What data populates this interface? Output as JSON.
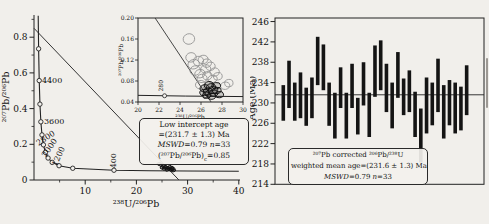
{
  "figure_type": "geochronology composite figure (Tera-Wasserburg concordia + weighted mean age)",
  "colors": {
    "ink": "#1a1a1a",
    "paper": "#f1efeb",
    "light_ellipse": "#909090",
    "dark_ellipse": "#161616"
  },
  "chart_data": [
    {
      "type": "scatter",
      "name": "tera-wasserburg-concordia",
      "xlabel": "²³⁸U/²⁰⁶Pb",
      "ylabel": "²⁰⁷Pb/²⁰⁶Pb",
      "xlim": [
        0,
        40
      ],
      "ylim": [
        0,
        0.92
      ],
      "xticks": [
        10,
        20,
        30,
        40
      ],
      "xminor": [
        5,
        15,
        25,
        35
      ],
      "ytick_labels": [
        "0",
        "0.2",
        "0.4",
        "0.6",
        "0.8"
      ],
      "yticks": [
        0,
        0.2,
        0.4,
        0.6,
        0.8
      ],
      "yminor": [
        0.1,
        0.3,
        0.5,
        0.7,
        0.9
      ],
      "concordia_curve": [
        [
          0.82,
          0.92
        ],
        [
          0.9,
          0.735
        ],
        [
          1.02,
          0.557
        ],
        [
          1.16,
          0.425
        ],
        [
          1.34,
          0.326
        ],
        [
          1.56,
          0.2525
        ],
        [
          1.84,
          0.197
        ],
        [
          2.22,
          0.155
        ],
        [
          2.75,
          0.123
        ],
        [
          3.55,
          0.0987
        ],
        [
          4.89,
          0.08
        ],
        [
          7.57,
          0.0658
        ],
        [
          15.62,
          0.0547
        ],
        [
          22.53,
          0.0519
        ],
        [
          30,
          0.0503
        ],
        [
          40,
          0.0493
        ]
      ],
      "age_markers": [
        [
          0.9,
          0.735
        ],
        [
          1.02,
          0.557
        ],
        [
          1.16,
          0.425
        ],
        [
          1.34,
          0.326
        ],
        [
          1.56,
          0.2525
        ],
        [
          1.84,
          0.197
        ],
        [
          2.22,
          0.155
        ],
        [
          2.75,
          0.123
        ],
        [
          3.55,
          0.0987
        ],
        [
          4.89,
          0.08
        ],
        [
          7.57,
          0.0658
        ],
        [
          15.62,
          0.0547
        ]
      ],
      "age_labels": [
        {
          "text": "4400",
          "x": 1.55,
          "y": 0.545,
          "rot": 0
        },
        {
          "text": "3600",
          "x": 1.95,
          "y": 0.315,
          "rot": 0
        },
        {
          "text": "2800",
          "x": 2.55,
          "y": 0.222,
          "rot": -33
        },
        {
          "text": "2000",
          "x": 3.45,
          "y": 0.172,
          "rot": -55
        },
        {
          "text": "1200",
          "x": 5.25,
          "y": 0.127,
          "rot": -66
        },
        {
          "text": "400",
          "x": 15.95,
          "y": 0.108,
          "rot": -90
        }
      ],
      "discordia": {
        "x1": 0,
        "y1": 0.85,
        "x2": 28.3,
        "y2": 0
      },
      "ellipses": [
        [
          24.45,
          0.091,
          0.42,
          0.008,
          -15
        ],
        [
          24.85,
          0.085,
          0.42,
          0.008,
          -15
        ],
        [
          25.25,
          0.079,
          0.42,
          0.008,
          -15
        ],
        [
          25.65,
          0.073,
          0.42,
          0.008,
          -15
        ],
        [
          26.05,
          0.068,
          0.42,
          0.008,
          -15
        ],
        [
          26.45,
          0.063,
          0.42,
          0.008,
          -15
        ],
        [
          26.85,
          0.058,
          0.42,
          0.008,
          -15
        ],
        [
          27.25,
          0.054,
          0.42,
          0.008,
          -15
        ],
        [
          25.45,
          0.064,
          0.42,
          0.008,
          -15
        ],
        [
          26.0,
          0.058,
          0.42,
          0.008,
          -15
        ],
        [
          26.5,
          0.073,
          0.42,
          0.008,
          -15
        ],
        [
          25.05,
          0.07,
          0.42,
          0.008,
          -15
        ],
        [
          26.9,
          0.068,
          0.42,
          0.008,
          -15
        ],
        [
          27.1,
          0.062,
          0.42,
          0.008,
          -15
        ]
      ],
      "annotation": {
        "line1": "Low intercept age",
        "line2": "=(231.7 ± 1.3) Ma",
        "mswd": "MSWD",
        "mswd_eq": "=0.79",
        "n": "n",
        "n_eq": "=33",
        "ratio": "(²⁰⁷Pb/²⁰⁶Pb)",
        "ratio_sub": "c",
        "ratio_eq": "=0.85"
      },
      "inset": {
        "xlabel": "²³⁸U/²⁰⁶Pb",
        "ylabel": "²⁰⁷Pb/²⁰⁶Pb",
        "xlim": [
          20,
          30
        ],
        "ylim": [
          0.04,
          0.2
        ],
        "xticks": [
          20,
          22,
          24,
          26,
          28,
          30
        ],
        "ytick_labels": [
          "0.04",
          "0.08",
          "0.12",
          "0.16",
          "0.20"
        ],
        "yticks": [
          0.04,
          0.08,
          0.12,
          0.16,
          0.2
        ],
        "concordia_curve": [
          [
            20,
            0.0527
          ],
          [
            22.53,
            0.0519
          ],
          [
            24.5,
            0.0513
          ],
          [
            26.36,
            0.051
          ],
          [
            28,
            0.0507
          ],
          [
            30,
            0.0503
          ]
        ],
        "age_markers": [
          [
            22.53,
            0.0519
          ],
          [
            26.36,
            0.051
          ]
        ],
        "age_labels": [
          {
            "text": "280",
            "x": 22.42,
            "y": 0.06,
            "rot": -90
          }
        ],
        "discordia": {
          "x1": 21.63,
          "y1": 0.2,
          "x2": 26.96,
          "y2": 0.04
        },
        "ellipses_light": [
          [
            24.85,
            0.16,
            0.55,
            0.01,
            -15
          ],
          [
            25.05,
            0.125,
            0.5,
            0.009,
            -12
          ],
          [
            25.3,
            0.112,
            0.55,
            0.009,
            -15
          ],
          [
            25.75,
            0.118,
            0.5,
            0.009,
            -12
          ],
          [
            26.2,
            0.121,
            0.48,
            0.008,
            -12
          ],
          [
            26.55,
            0.114,
            0.45,
            0.008,
            -12
          ],
          [
            25.45,
            0.1,
            0.5,
            0.009,
            -12
          ],
          [
            25.9,
            0.094,
            0.5,
            0.008,
            -12
          ],
          [
            26.45,
            0.103,
            0.48,
            0.008,
            -10
          ],
          [
            26.9,
            0.108,
            0.45,
            0.008,
            -10
          ],
          [
            27.3,
            0.097,
            0.45,
            0.008,
            -10
          ],
          [
            26.1,
            0.085,
            0.48,
            0.008,
            -10
          ],
          [
            26.6,
            0.09,
            0.45,
            0.008,
            -10
          ],
          [
            27.1,
            0.084,
            0.45,
            0.007,
            -10
          ],
          [
            27.6,
            0.089,
            0.42,
            0.007,
            -10
          ],
          [
            25.95,
            0.073,
            0.48,
            0.008,
            -10
          ],
          [
            28.3,
            0.071,
            0.45,
            0.007,
            -8
          ],
          [
            28.65,
            0.076,
            0.4,
            0.007,
            -8
          ]
        ],
        "ellipses_dark": [
          [
            26.35,
            0.066,
            0.45,
            0.007,
            -10
          ],
          [
            26.65,
            0.06,
            0.42,
            0.007,
            -10
          ],
          [
            26.95,
            0.068,
            0.45,
            0.007,
            -10
          ],
          [
            27.2,
            0.057,
            0.42,
            0.006,
            -8
          ],
          [
            26.55,
            0.053,
            0.4,
            0.006,
            -8
          ],
          [
            27.5,
            0.062,
            0.42,
            0.006,
            -8
          ],
          [
            27.0,
            0.051,
            0.4,
            0.006,
            -8
          ],
          [
            26.3,
            0.058,
            0.42,
            0.006,
            -8
          ],
          [
            27.45,
            0.071,
            0.42,
            0.006,
            -8
          ],
          [
            27.75,
            0.054,
            0.4,
            0.006,
            -8
          ],
          [
            27.15,
            0.063,
            0.45,
            0.007,
            -8
          ],
          [
            26.75,
            0.072,
            0.45,
            0.007,
            -10
          ]
        ]
      }
    },
    {
      "type": "bar-range",
      "name": "weighted-mean-age",
      "ylabel": "Age (Ma)",
      "ylim": [
        214,
        246.7
      ],
      "yticks": [
        214,
        218,
        222,
        226,
        230,
        234,
        238,
        242,
        246
      ],
      "mean_age": 231.6,
      "bars": [
        [
          226.5,
          233.5
        ],
        [
          229.0,
          238.3
        ],
        [
          226.5,
          234.0
        ],
        [
          227.0,
          236.0
        ],
        [
          225.5,
          233.0
        ],
        [
          227.0,
          235.0
        ],
        [
          233.5,
          243.0
        ],
        [
          232.5,
          241.5
        ],
        [
          225.5,
          234.0
        ],
        [
          223.0,
          232.0
        ],
        [
          229.0,
          237.0
        ],
        [
          223.0,
          232.0
        ],
        [
          229.0,
          237.7
        ],
        [
          223.8,
          231.0
        ],
        [
          229.5,
          238.0
        ],
        [
          223.3,
          232.0
        ],
        [
          231.2,
          241.3
        ],
        [
          232.5,
          242.3
        ],
        [
          228.2,
          237.7
        ],
        [
          225.0,
          234.0
        ],
        [
          231.0,
          240.0
        ],
        [
          227.6,
          234.8
        ],
        [
          228.2,
          236.4
        ],
        [
          223.3,
          232.2
        ],
        [
          218.3,
          228.9
        ],
        [
          224.0,
          235.0
        ],
        [
          225.6,
          234.0
        ],
        [
          228.2,
          238.7
        ],
        [
          223.0,
          233.5
        ],
        [
          225.6,
          234.5
        ],
        [
          224.0,
          234.0
        ],
        [
          224.6,
          233.2
        ],
        [
          227.6,
          237.4
        ]
      ],
      "annotation": {
        "line1": "²⁰⁷Pb corrected ²⁰⁶Pb/²³⁸U",
        "line2": "weighted mean age=(231.6 ± 1.3) Ma",
        "mswd": "MSWD",
        "mswd_eq": "=0.79",
        "n": "n",
        "n_eq": "=33"
      }
    }
  ]
}
